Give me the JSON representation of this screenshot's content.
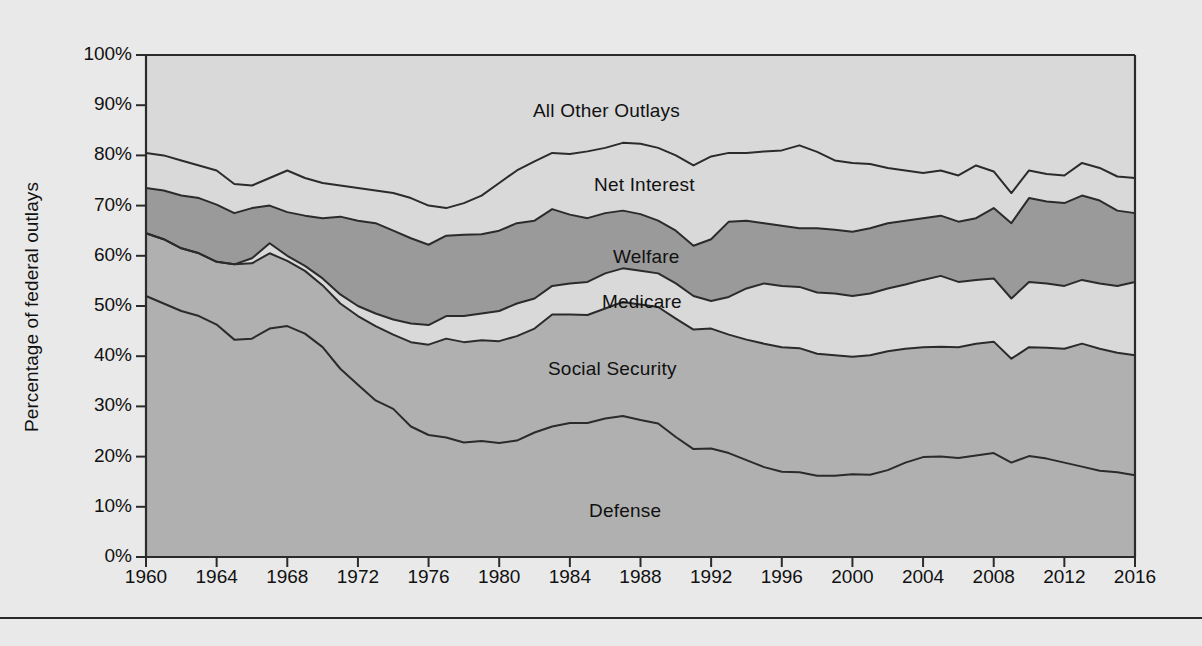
{
  "figure": {
    "background_color": "#e9e9e9",
    "plot_background_color": "#d9d9d9",
    "line_color": "#2b2b2b"
  },
  "axes": {
    "ylabel": "Percentage of federal outlays",
    "yticks": [
      "0%",
      "10%",
      "20%",
      "30%",
      "40%",
      "50%",
      "60%",
      "70%",
      "80%",
      "90%",
      "100%"
    ],
    "xticks": [
      "1960",
      "1964",
      "1968",
      "1972",
      "1976",
      "1980",
      "1984",
      "1988",
      "1992",
      "1996",
      "2000",
      "2004",
      "2008",
      "2012",
      "2016"
    ]
  },
  "series_labels": {
    "all_other_outlays": "All Other Outlays",
    "net_interest": "Net Interest",
    "welfare": "Welfare",
    "medicare": "Medicare",
    "social_security": "Social Security",
    "defense": "Defense"
  },
  "chart_data": {
    "type": "area",
    "title": "",
    "xlabel": "",
    "ylabel": "Percentage of federal outlays",
    "xlim": [
      1960,
      2016
    ],
    "ylim": [
      0,
      100
    ],
    "grid": false,
    "legend": "inline-labels",
    "stacked": true,
    "stack_order_bottom_to_top": [
      "Defense",
      "Social Security",
      "Medicare",
      "Welfare",
      "Net Interest",
      "All Other Outlays"
    ],
    "colors": {
      "Defense": "#b0b0b0",
      "Social Security": "#b0b0b0",
      "Medicare": "#d9d9d9",
      "Welfare": "#9a9a9a",
      "Net Interest": "#d9d9d9",
      "All Other Outlays": "#d9d9d9"
    },
    "x": [
      1960,
      1961,
      1962,
      1963,
      1964,
      1965,
      1966,
      1967,
      1968,
      1969,
      1970,
      1971,
      1972,
      1973,
      1974,
      1975,
      1976,
      1977,
      1978,
      1979,
      1980,
      1981,
      1982,
      1983,
      1984,
      1985,
      1986,
      1987,
      1988,
      1989,
      1990,
      1991,
      1992,
      1993,
      1994,
      1995,
      1996,
      1997,
      1998,
      1999,
      2000,
      2001,
      2002,
      2003,
      2004,
      2005,
      2006,
      2007,
      2008,
      2009,
      2010,
      2011,
      2012,
      2013,
      2014,
      2015,
      2016
    ],
    "cumulative_tops": {
      "Defense": [
        52.0,
        50.5,
        49.0,
        48.0,
        46.3,
        43.3,
        43.5,
        45.5,
        46.0,
        44.5,
        41.8,
        37.5,
        34.3,
        31.2,
        29.5,
        26.0,
        24.3,
        23.8,
        22.8,
        23.1,
        22.7,
        23.2,
        24.8,
        26.0,
        26.7,
        26.7,
        27.6,
        28.1,
        27.3,
        26.6,
        23.9,
        21.5,
        21.6,
        20.7,
        19.3,
        17.9,
        17.0,
        16.9,
        16.2,
        16.2,
        16.5,
        16.4,
        17.3,
        18.8,
        19.9,
        20.0,
        19.7,
        20.2,
        20.7,
        18.8,
        20.1,
        19.6,
        18.8,
        18.0,
        17.2,
        16.9,
        16.3
      ],
      "Social Security": [
        64.5,
        63.3,
        61.5,
        60.5,
        58.8,
        58.3,
        58.5,
        60.5,
        59.0,
        57.0,
        54.1,
        50.5,
        48.0,
        46.0,
        44.3,
        42.8,
        42.3,
        43.5,
        42.8,
        43.2,
        43.0,
        44.0,
        45.5,
        48.3,
        48.3,
        48.2,
        49.5,
        50.8,
        50.3,
        49.8,
        47.5,
        45.3,
        45.5,
        44.3,
        43.3,
        42.5,
        41.8,
        41.6,
        40.5,
        40.2,
        39.9,
        40.2,
        41.0,
        41.5,
        41.8,
        41.9,
        41.8,
        42.5,
        42.9,
        39.5,
        41.8,
        41.7,
        41.5,
        42.5,
        41.5,
        40.7,
        40.2
      ],
      "Medicare": [
        64.5,
        63.3,
        61.5,
        60.5,
        58.8,
        58.3,
        59.5,
        62.5,
        60.0,
        58.0,
        55.5,
        52.3,
        50.0,
        48.5,
        47.3,
        46.5,
        46.2,
        48.0,
        48.0,
        48.5,
        49.0,
        50.5,
        51.5,
        54.0,
        54.5,
        54.8,
        56.5,
        57.5,
        57.0,
        56.5,
        54.5,
        52.0,
        51.0,
        51.8,
        53.5,
        54.5,
        54.0,
        53.8,
        52.7,
        52.5,
        52.0,
        52.5,
        53.5,
        54.3,
        55.2,
        56.0,
        54.8,
        55.2,
        55.5,
        51.5,
        54.8,
        54.5,
        54.0,
        55.2,
        54.5,
        54.0,
        54.8
      ],
      "Welfare": [
        73.5,
        73.0,
        72.0,
        71.5,
        70.2,
        68.5,
        69.5,
        70.0,
        68.7,
        68.0,
        67.5,
        67.8,
        67.0,
        66.5,
        65.0,
        63.5,
        62.2,
        64.0,
        64.2,
        64.3,
        65.0,
        66.5,
        67.0,
        69.3,
        68.2,
        67.5,
        68.5,
        69.0,
        68.3,
        67.0,
        65.0,
        62.0,
        63.3,
        66.8,
        67.0,
        66.5,
        66.0,
        65.5,
        65.5,
        65.2,
        64.8,
        65.5,
        66.5,
        67.0,
        67.5,
        68.0,
        66.8,
        67.5,
        69.5,
        66.5,
        71.5,
        70.8,
        70.5,
        72.0,
        71.0,
        69.0,
        68.5
      ],
      "Net Interest": [
        80.5,
        80.0,
        79.0,
        78.0,
        77.0,
        74.3,
        74.0,
        75.5,
        77.0,
        75.5,
        74.5,
        74.0,
        73.5,
        73.0,
        72.5,
        71.5,
        70.0,
        69.5,
        70.5,
        72.0,
        74.5,
        77.0,
        78.8,
        80.5,
        80.3,
        80.8,
        81.5,
        82.5,
        82.3,
        81.5,
        80.0,
        78.0,
        79.8,
        80.5,
        80.5,
        80.8,
        81.0,
        82.0,
        80.7,
        79.0,
        78.5,
        78.3,
        77.5,
        77.0,
        76.5,
        77.0,
        76.0,
        78.0,
        76.8,
        72.5,
        77.0,
        76.3,
        76.0,
        78.5,
        77.5,
        75.8,
        75.5
      ],
      "All Other Outlays": [
        100,
        100,
        100,
        100,
        100,
        100,
        100,
        100,
        100,
        100,
        100,
        100,
        100,
        100,
        100,
        100,
        100,
        100,
        100,
        100,
        100,
        100,
        100,
        100,
        100,
        100,
        100,
        100,
        100,
        100,
        100,
        100,
        100,
        100,
        100,
        100,
        100,
        100,
        100,
        100,
        100,
        100,
        100,
        100,
        100,
        100,
        100,
        100,
        100,
        100,
        100,
        100,
        100,
        100,
        100,
        100,
        100
      ]
    }
  }
}
